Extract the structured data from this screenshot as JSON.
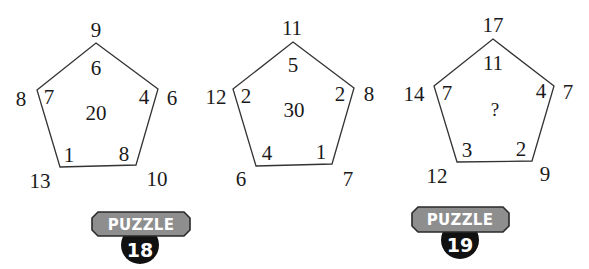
{
  "puzzles": [
    {
      "id": "puzzle-a",
      "center": "20",
      "outer": {
        "top": "9",
        "left": "8",
        "right": "6",
        "bottom_left": "13",
        "bottom_right": "10"
      },
      "inner": {
        "top": "6",
        "left": "7",
        "right": "4",
        "bottom_left": "1",
        "bottom_right": "8"
      }
    },
    {
      "id": "puzzle-b",
      "center": "30",
      "outer": {
        "top": "11",
        "left": "12",
        "right": "8",
        "bottom_left": "6",
        "bottom_right": "7"
      },
      "inner": {
        "top": "5",
        "left": "2",
        "right": "2",
        "bottom_left": "4",
        "bottom_right": "1"
      }
    },
    {
      "id": "puzzle-c",
      "center": "?",
      "outer": {
        "top": "17",
        "left": "14",
        "right": "7",
        "bottom_left": "12",
        "bottom_right": "9"
      },
      "inner": {
        "top": "11",
        "left": "7",
        "right": "4",
        "bottom_left": "3",
        "bottom_right": "2"
      }
    }
  ],
  "badges": [
    {
      "label": "PUZZLE",
      "number": "18"
    },
    {
      "label": "PUZZLE",
      "number": "19"
    }
  ],
  "colors": {
    "line": "#333333",
    "text": "#1a1a1a",
    "badge_banner": "#8e8e8e",
    "badge_border": "#2a2a2a",
    "badge_circle": "#111111"
  }
}
